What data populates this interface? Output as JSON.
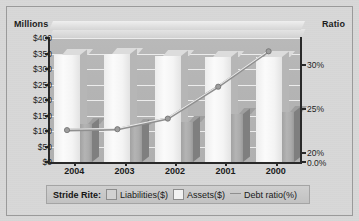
{
  "chart_data": {
    "type": "bar",
    "title": "",
    "categories": [
      "2004",
      "2003",
      "2002",
      "2001",
      "2000"
    ],
    "series": [
      {
        "name": "Assets($)",
        "axis": "left",
        "values": [
          345,
          347,
          343,
          340,
          338
        ]
      },
      {
        "name": "Liabilities($)",
        "axis": "left",
        "values": [
          122,
          120,
          128,
          155,
          160
        ]
      },
      {
        "name": "Debt ratio(%)",
        "axis": "right",
        "type": "line",
        "values": [
          22.6,
          22.7,
          23.9,
          27.5,
          31.5
        ]
      }
    ],
    "left_axis": {
      "label": "Millions",
      "ticks": [
        "$0",
        "$50",
        "$100",
        "$150",
        "$200",
        "$250",
        "$300",
        "$350",
        "$400"
      ],
      "tick_values": [
        0,
        50,
        100,
        150,
        200,
        250,
        300,
        350,
        400
      ],
      "ylim": [
        0,
        400
      ]
    },
    "right_axis": {
      "label": "Ratio",
      "ticks": [
        "0.0%",
        "20%",
        "25%",
        "30%"
      ],
      "tick_values": [
        0.0,
        20,
        25,
        30
      ],
      "ylim": [
        19.0,
        33.0
      ]
    },
    "xlabel": "",
    "grid": true,
    "legend_position": "bottom"
  },
  "axes": {
    "left_title": "Millions",
    "right_title": "Ratio"
  },
  "legend": {
    "title": "Stride Rite:",
    "items": [
      {
        "label": "Liabilities($)",
        "swatch": "liabilities-swatch"
      },
      {
        "label": "Assets($)",
        "swatch": "assets-swatch"
      },
      {
        "label": "Debt ratio(%)",
        "swatch": "debt-ratio-line-swatch"
      }
    ]
  },
  "colors": {
    "background": "#d8d8d8",
    "plot_back": "#b4b4b4",
    "assets_bar": "#f4f4f4",
    "liabilities_bar": "#ababab",
    "line": "#c9c9c9",
    "axis": "#2a2a2a",
    "gridline": "#ececec",
    "legend_bg": "#c8c8c8"
  }
}
